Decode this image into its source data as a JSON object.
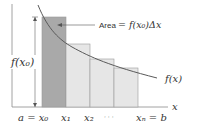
{
  "diagram": {
    "colors": {
      "first_bar": "#a9a9a9",
      "other_bars": "#e6e6e6",
      "bar_stroke": "#9a9a9a",
      "curve": "#5a5a5a",
      "axis": "#8a8a8a",
      "text": "#333333"
    },
    "annotation": {
      "label_prefix": "Area",
      "label_formula": "= f(x₀)Δx"
    },
    "height_label": "f(x₀)",
    "curve_label": "f(x)",
    "axis_label": "x",
    "tick_labels": {
      "x0": "a = x₀",
      "x1": "x₁",
      "x2": "x₂",
      "dots": "· · ·",
      "xn": "xₙ = b"
    },
    "bars": [
      {
        "name": "rect-1",
        "x": 42,
        "top": 17
      },
      {
        "name": "rect-2",
        "x": 66,
        "top": 44
      },
      {
        "name": "rect-3",
        "x": 90,
        "top": 59
      },
      {
        "name": "rect-4",
        "x": 114,
        "top": 68
      }
    ]
  }
}
